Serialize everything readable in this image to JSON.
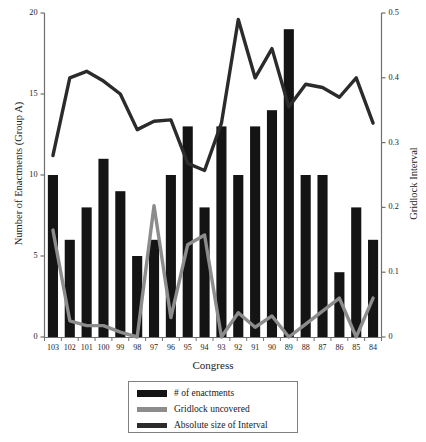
{
  "chart_data": {
    "type": "bar",
    "title": "",
    "xlabel": "Congress",
    "ylabel": "Number of Enactments (Group A)",
    "y2label": "Gridlock Interval",
    "categories": [
      "103",
      "102",
      "101",
      "100",
      "99",
      "98",
      "97",
      "96",
      "95",
      "94",
      "93",
      "92",
      "91",
      "90",
      "89",
      "88",
      "87",
      "86",
      "85",
      "84"
    ],
    "ylim": [
      0,
      20
    ],
    "yticks": [
      "0",
      "5",
      "10",
      "15",
      "20"
    ],
    "y2lim": [
      0,
      0.5
    ],
    "y2ticks": [
      "0",
      "0.1",
      "0.2",
      "0.3",
      "0.4",
      "0.5"
    ],
    "grid": false,
    "legend_position": "below",
    "series": [
      {
        "name": "# of enactments",
        "type": "bar",
        "axis": "left",
        "color": "#141414",
        "values": [
          10,
          6,
          8,
          11,
          9,
          5,
          6,
          10,
          13,
          8,
          13,
          10,
          13,
          14,
          19,
          10,
          10,
          4,
          8,
          6
        ]
      },
      {
        "name": "Gridlock uncovered",
        "type": "line",
        "axis": "left",
        "color": "#8c8c8c",
        "values": [
          6.6,
          1.0,
          0.7,
          0.7,
          0.3,
          0.0,
          8.1,
          1.2,
          5.7,
          6.3,
          0.0,
          1.5,
          0.6,
          1.3,
          0.0,
          0.8,
          1.6,
          2.4,
          0.0,
          2.4
        ]
      },
      {
        "name": "Absolute size of Interval",
        "type": "line",
        "axis": "right",
        "color": "#2b2b2b",
        "values": [
          0.28,
          0.4,
          0.41,
          0.395,
          0.375,
          0.32,
          0.333,
          0.335,
          0.268,
          0.257,
          0.33,
          0.49,
          0.4,
          0.445,
          0.355,
          0.39,
          0.385,
          0.37,
          0.4,
          0.33
        ],
        "values_left_scale": [
          11.2,
          15.9,
          16.5,
          15.8,
          15.0,
          12.9,
          13.3,
          13.4,
          10.7,
          10.3,
          13.2,
          19.7,
          16.0,
          17.8,
          14.2,
          15.6,
          15.4,
          14.8,
          16.0,
          13.2
        ]
      }
    ]
  },
  "legend": {
    "items": [
      {
        "label": "# of enactments",
        "color": "#141414",
        "marker": "bar-swatch"
      },
      {
        "label": "Gridlock uncovered",
        "color": "#8c8c8c",
        "marker": "line-swatch"
      },
      {
        "label": "Absolute size of Interval",
        "color": "#2b2b2b",
        "marker": "line-swatch"
      }
    ]
  },
  "colors": {
    "bars": "#141414",
    "gridlock_line": "#8c8c8c",
    "interval_line": "#2b2b2b",
    "axis": "#6f6f6f",
    "text": "#1a1a1a",
    "background": "#ffffff"
  }
}
